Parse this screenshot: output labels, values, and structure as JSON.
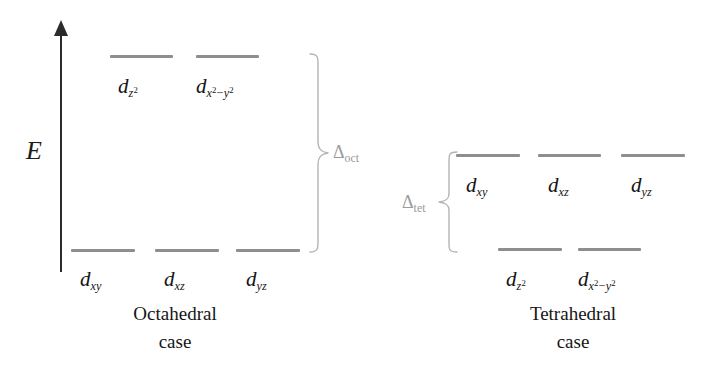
{
  "figure": {
    "background_color": "#ffffff",
    "bar_color": "#8e8e8e",
    "brace_color": "#b4b4b4",
    "text_color": "#151515",
    "delta_color": "#9a9a9a"
  },
  "axis": {
    "label": "E",
    "name": "energy-axis",
    "direction": "up"
  },
  "octahedral": {
    "caption_line1": "Octahedral",
    "caption_line2": "case",
    "splitting_label": "Δ",
    "splitting_subscript": "oct",
    "upper_level": {
      "count": 2,
      "orbitals": [
        {
          "base": "d",
          "sub": "z",
          "sup": "2",
          "display": "dz2"
        },
        {
          "base": "d",
          "sub": "x",
          "sup": "2",
          "sub2": "y",
          "sup2": "2",
          "display": "dx2-y2"
        }
      ]
    },
    "lower_level": {
      "count": 3,
      "orbitals": [
        {
          "base": "d",
          "sub": "xy",
          "display": "dxy"
        },
        {
          "base": "d",
          "sub": "xz",
          "display": "dxz"
        },
        {
          "base": "d",
          "sub": "yz",
          "display": "dyz"
        }
      ]
    }
  },
  "tetrahedral": {
    "caption_line1": "Tetrahedral",
    "caption_line2": "case",
    "splitting_label": "Δ",
    "splitting_subscript": "tet",
    "upper_level": {
      "count": 3,
      "orbitals": [
        {
          "base": "d",
          "sub": "xy",
          "display": "dxy"
        },
        {
          "base": "d",
          "sub": "xz",
          "display": "dxz"
        },
        {
          "base": "d",
          "sub": "yz",
          "display": "dyz"
        }
      ]
    },
    "lower_level": {
      "count": 2,
      "orbitals": [
        {
          "base": "d",
          "sub": "z",
          "sup": "2",
          "display": "dz2"
        },
        {
          "base": "d",
          "sub": "x",
          "sup": "2",
          "sub2": "y",
          "sup2": "2",
          "display": "dx2-y2"
        }
      ]
    }
  },
  "labels": {
    "d": "d",
    "xy": "xy",
    "xz": "xz",
    "yz": "yz",
    "z": "z",
    "x": "x",
    "y": "y",
    "two": "2",
    "minus": "−",
    "delta": "Δ",
    "oct": "oct",
    "tet": "tet"
  }
}
